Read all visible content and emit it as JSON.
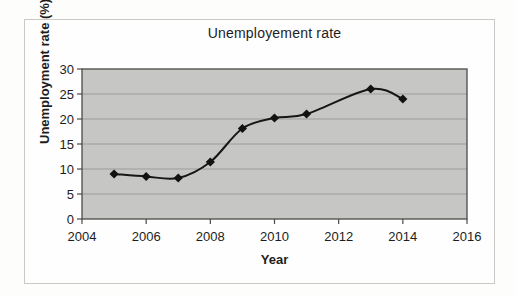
{
  "chart_data": {
    "type": "line",
    "title": "Unemployement rate",
    "xlabel": "Year",
    "ylabel": "Unemployment rate (%)",
    "series": [
      {
        "name": "Unemployment rate",
        "x": [
          2005,
          2006,
          2007,
          2008,
          2009,
          2010,
          2011,
          2013,
          2014
        ],
        "values": [
          9,
          8.5,
          8.2,
          11.4,
          18.1,
          20.2,
          21,
          26,
          24
        ]
      }
    ],
    "xlim": [
      2004,
      2016
    ],
    "ylim": [
      0,
      30
    ],
    "x_ticks": [
      2004,
      2006,
      2008,
      2010,
      2012,
      2014,
      2016
    ],
    "y_ticks": [
      0,
      5,
      10,
      15,
      20,
      25,
      30
    ],
    "grid": "horizontal",
    "legend_position": "none",
    "line_smooth": true,
    "marker": "diamond",
    "colors": {
      "plot_background": "#c6c6c4",
      "gridline": "#9c9c9a",
      "plot_border": "#4a4a48",
      "series_line": "#161616",
      "marker_fill": "#121212",
      "tick_text": "#1d1d1d"
    }
  }
}
